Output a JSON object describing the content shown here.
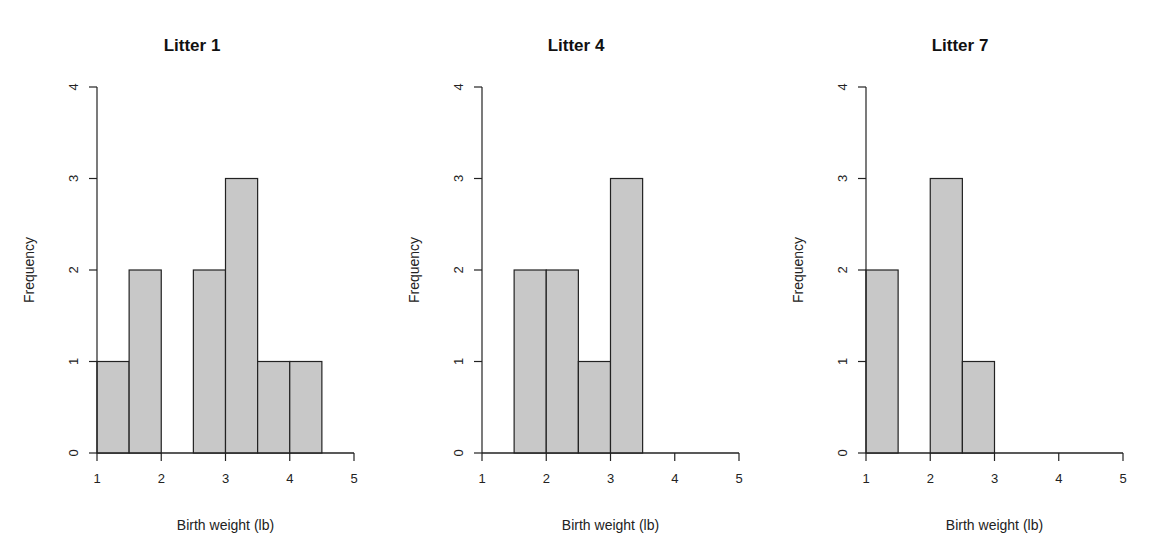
{
  "chart_data": [
    {
      "type": "bar",
      "title": "Litter 1",
      "xlabel": "Birth weight (lb)",
      "ylabel": "Frequency",
      "bin_edges": [
        1.0,
        1.5,
        2.0,
        2.5,
        3.0,
        3.5,
        4.0,
        4.5
      ],
      "values": [
        1,
        2,
        0,
        2,
        3,
        1,
        1
      ],
      "xlim": [
        1,
        5
      ],
      "ylim": [
        0,
        4
      ],
      "xticks": [
        1,
        2,
        3,
        4,
        5
      ],
      "yticks": [
        0,
        1,
        2,
        3,
        4
      ],
      "grid": false
    },
    {
      "type": "bar",
      "title": "Litter 4",
      "xlabel": "Birth weight (lb)",
      "ylabel": "Frequency",
      "bin_edges": [
        1.5,
        2.0,
        2.5,
        3.0,
        3.5
      ],
      "values": [
        2,
        2,
        1,
        3
      ],
      "xlim": [
        1,
        5
      ],
      "ylim": [
        0,
        4
      ],
      "xticks": [
        1,
        2,
        3,
        4,
        5
      ],
      "yticks": [
        0,
        1,
        2,
        3,
        4
      ],
      "grid": false
    },
    {
      "type": "bar",
      "title": "Litter 7",
      "xlabel": "Birth weight (lb)",
      "ylabel": "Frequency",
      "bin_edges": [
        1.0,
        1.5,
        2.0,
        2.5,
        3.0
      ],
      "values": [
        2,
        0,
        3,
        1
      ],
      "xlim": [
        1,
        5
      ],
      "ylim": [
        0,
        4
      ],
      "xticks": [
        1,
        2,
        3,
        4,
        5
      ],
      "yticks": [
        0,
        1,
        2,
        3,
        4
      ],
      "grid": false
    }
  ],
  "style": {
    "bar_fill": "#c8c8c8",
    "bar_stroke": "#222222",
    "axis_color": "#222222"
  }
}
